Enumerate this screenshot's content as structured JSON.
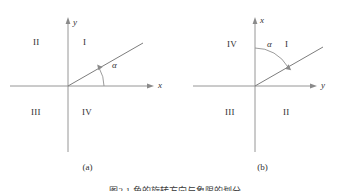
{
  "figure": {
    "caption": "图2-1 角的旋转方向与象限的划分",
    "panels": [
      {
        "id": "a",
        "sub_caption": "(a)",
        "vertical_axis_label": "y",
        "horizontal_axis_label": "x",
        "angle_label": "α",
        "quadrants": {
          "upper_left": "II",
          "upper_right": "I",
          "lower_left": "III",
          "lower_right": "IV"
        },
        "ray_angle_deg": 30,
        "rotation_direction": "counterclockwise",
        "rotation_start_axis": "x",
        "origin": {
          "x": 68,
          "y": 86
        }
      },
      {
        "id": "b",
        "sub_caption": "(b)",
        "vertical_axis_label": "x",
        "horizontal_axis_label": "y",
        "angle_label": "α",
        "quadrants": {
          "upper_left": "IV",
          "upper_right": "I",
          "lower_left": "III",
          "lower_right": "II"
        },
        "ray_angle_deg": 30,
        "rotation_direction": "clockwise",
        "rotation_start_axis": "x",
        "origin": {
          "x": 80,
          "y": 86
        }
      }
    ]
  },
  "colors": {
    "axis": "#8a8a8a",
    "ray": "#7d7d7d",
    "text": "#2f2f2f",
    "background": "#ffffff"
  }
}
